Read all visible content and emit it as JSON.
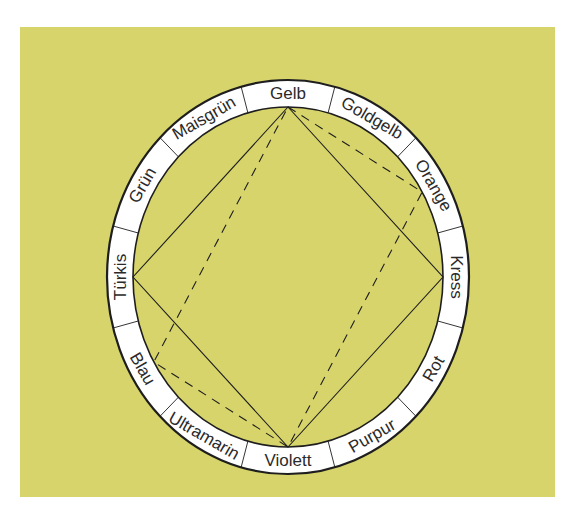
{
  "colors": {
    "page": "#ffffff",
    "background": "#d6d46a",
    "ring_fill": "#ffffff",
    "ink": "#1e1e1e"
  },
  "wheel": {
    "center": [
      288,
      277
    ],
    "outer": {
      "rx": 181,
      "ry": 197
    },
    "inner": {
      "rx": 155,
      "ry": 170
    },
    "segments": [
      {
        "label": "Gelb"
      },
      {
        "label": "Goldgelb"
      },
      {
        "label": "Orange"
      },
      {
        "label": "Kress"
      },
      {
        "label": "Rot"
      },
      {
        "label": "Purpur"
      },
      {
        "label": "Violett"
      },
      {
        "label": "Ultramarin"
      },
      {
        "label": "Blau"
      },
      {
        "label": "Türkis"
      },
      {
        "label": "Grün"
      },
      {
        "label": "Maisgrün"
      }
    ]
  },
  "shapes": {
    "solid_square": {
      "style": "solid",
      "vertices": [
        "Gelb",
        "Kress",
        "Violett",
        "Türkis"
      ]
    },
    "dashed_rectangle": {
      "style": "dashed",
      "vertices": [
        "Gelb",
        "Orange",
        "Violett",
        "Blau"
      ]
    }
  }
}
